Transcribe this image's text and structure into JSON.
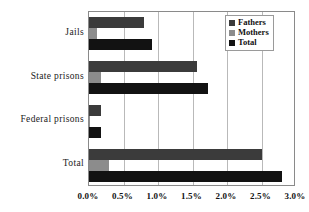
{
  "chart_data": {
    "type": "bar",
    "orientation": "horizontal",
    "title": "",
    "xlabel": "",
    "ylabel": "",
    "xlim": [
      0,
      3
    ],
    "xticks": [
      "0.0%",
      "0.5%",
      "1.0%",
      "1.5%",
      "2.0%",
      "2.5%",
      "3.0%"
    ],
    "xtick_values": [
      0,
      0.5,
      1.0,
      1.5,
      2.0,
      2.5,
      3.0
    ],
    "grid": "vertical",
    "legend_position": "top-right",
    "categories": [
      "Jails",
      "State prisons",
      "Federal prisons",
      "Total"
    ],
    "series": [
      {
        "name": "Fathers",
        "color": "#3b3b3b",
        "values": [
          0.8,
          1.57,
          0.18,
          2.5
        ]
      },
      {
        "name": "Mothers",
        "color": "#8c8c8c",
        "values": [
          0.12,
          0.18,
          0.02,
          0.29
        ]
      },
      {
        "name": "Total",
        "color": "#121212",
        "values": [
          0.92,
          1.72,
          0.18,
          2.79
        ]
      }
    ]
  },
  "legend": {
    "items": [
      {
        "label": "Fathers",
        "swatch": "fathers"
      },
      {
        "label": "Mothers",
        "swatch": "mothers"
      },
      {
        "label": "Total",
        "swatch": "total"
      }
    ]
  },
  "axis": {
    "x_ticks": [
      "0.0%",
      "0.5%",
      "1.0%",
      "1.5%",
      "2.0%",
      "2.5%",
      "3.0%"
    ],
    "y_categories": [
      "Jails",
      "State prisons",
      "Federal prisons",
      "Total"
    ]
  }
}
